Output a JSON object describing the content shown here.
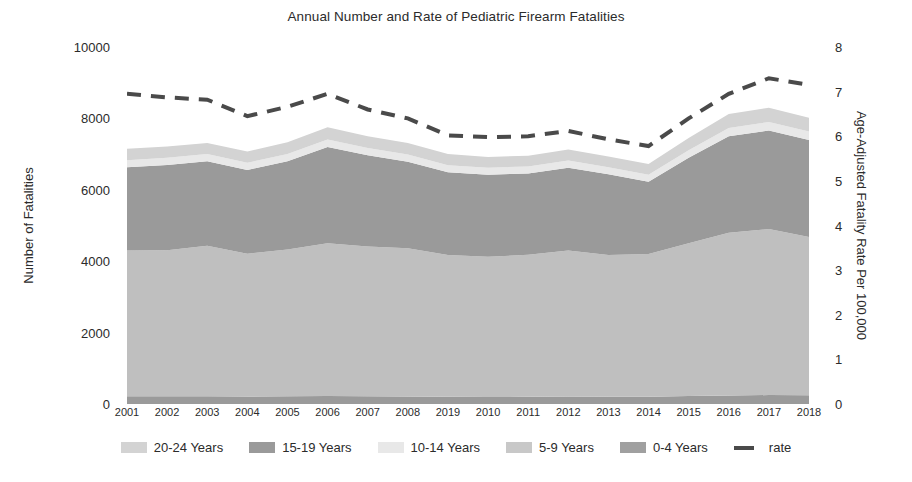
{
  "chart_data": {
    "type": "area",
    "title": "Annual Number and Rate of Pediatric Firearm Fatalities",
    "xlabel": "",
    "ylabel": "Number of Fatalities",
    "y2label": "Age-Adjusted Fatality Rate Per 100,000",
    "grid": false,
    "legend_position": "bottom",
    "stacked": true,
    "categories": [
      "2001",
      "2002",
      "2003",
      "2004",
      "2005",
      "2006",
      "2007",
      "2008",
      "2019",
      "2010",
      "2011",
      "2012",
      "2013",
      "2014",
      "2015",
      "2016",
      "2017",
      "2018"
    ],
    "ylim": [
      0,
      10000
    ],
    "yticks": [
      0,
      2000,
      4000,
      6000,
      8000,
      10000
    ],
    "y2lim": [
      0,
      8
    ],
    "y2ticks": [
      0,
      1,
      2,
      3,
      4,
      5,
      6,
      7,
      8
    ],
    "series": [
      {
        "name": "0-4 Years",
        "color": "#9a9a9a",
        "stack_order": 1,
        "values": [
          220,
          215,
          220,
          210,
          215,
          225,
          215,
          210,
          200,
          195,
          200,
          210,
          200,
          205,
          225,
          240,
          250,
          245
        ]
      },
      {
        "name": "5-9 Years",
        "color": "#bfbfbf",
        "stack_order": 2,
        "values": [
          4080,
          4090,
          4215,
          4000,
          4110,
          4275,
          4200,
          4150,
          3975,
          3930,
          3980,
          4090,
          3975,
          4000,
          4275,
          4560,
          4650,
          4435
        ]
      },
      {
        "name": "10-14 Years",
        "color": "#9a9a9a",
        "stack_order": 3,
        "values": [
          2330,
          2390,
          2365,
          2345,
          2475,
          2700,
          2550,
          2425,
          2320,
          2300,
          2280,
          2320,
          2260,
          2020,
          2400,
          2700,
          2760,
          2715
        ]
      },
      {
        "name": "15-19 Years",
        "color": "#e8e8e8",
        "stack_order": 4,
        "values": [
          200,
          200,
          200,
          200,
          205,
          210,
          205,
          205,
          195,
          195,
          195,
          200,
          195,
          195,
          210,
          230,
          240,
          235
        ]
      },
      {
        "name": "20-24 Years",
        "color": "#d3d3d3",
        "stack_order": 5,
        "values": [
          320,
          320,
          310,
          315,
          330,
          340,
          330,
          320,
          310,
          300,
          300,
          310,
          300,
          300,
          340,
          390,
          400,
          390
        ]
      }
    ],
    "rate_series": {
      "name": "rate",
      "color": "#4a4a4a",
      "style": "dashed",
      "axis": "right",
      "values": [
        6.95,
        6.87,
        6.82,
        6.45,
        6.66,
        6.95,
        6.6,
        6.4,
        6.02,
        5.98,
        6.0,
        6.12,
        5.93,
        5.78,
        6.4,
        6.95,
        7.3,
        7.15
      ]
    }
  },
  "legend": {
    "items": [
      {
        "label": "20-24 Years",
        "marker": "swatch",
        "color": "#d3d3d3"
      },
      {
        "label": "15-19 Years",
        "marker": "swatch",
        "color": "#9a9a9a"
      },
      {
        "label": "10-14 Years",
        "marker": "swatch",
        "color": "#e8e8e8"
      },
      {
        "label": "5-9 Years",
        "marker": "swatch",
        "color": "#c8c8c8"
      },
      {
        "label": "0-4 Years",
        "marker": "swatch",
        "color": "#a0a0a0"
      },
      {
        "label": "rate",
        "marker": "dash",
        "color": "#4a4a4a"
      }
    ]
  }
}
